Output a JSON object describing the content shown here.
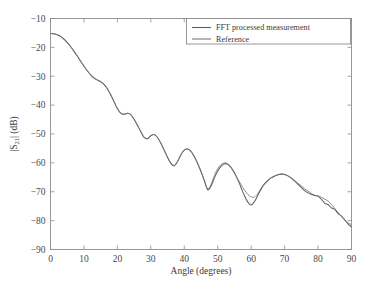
{
  "figure": {
    "background_color": "#ffffff",
    "frame_color": "#8d8d8d",
    "text_color": "#3a3a3a"
  },
  "axes": {
    "x_title": "Angle (degrees)",
    "y_title_main": "|S",
    "y_title_sub": "21",
    "y_title_tail": "| (dB)",
    "x_ticks": [
      "0",
      "10",
      "20",
      "30",
      "40",
      "50",
      "60",
      "70",
      "80",
      "90"
    ],
    "y_ticks": [
      "−10",
      "−20",
      "−30",
      "−40",
      "−50",
      "−60",
      "−70",
      "−80",
      "−90"
    ]
  },
  "legend": {
    "position": "top-right",
    "items": [
      {
        "label": "FFT processed measurement",
        "color": "#5e5e5e"
      },
      {
        "label": "Reference",
        "color": "#7a7a7a"
      }
    ]
  },
  "chart_data": {
    "type": "line",
    "title": "",
    "xlabel": "Angle (degrees)",
    "ylabel": "|S21| (dB)",
    "xlim": [
      0,
      90
    ],
    "ylim": [
      -90,
      -10
    ],
    "xticks": [
      0,
      10,
      20,
      30,
      40,
      50,
      60,
      70,
      80,
      90
    ],
    "yticks": [
      -90,
      -80,
      -70,
      -60,
      -50,
      -40,
      -30,
      -20,
      -10
    ],
    "grid": false,
    "legend_position": "upper right",
    "x": [
      0,
      1,
      2,
      3,
      4,
      5,
      6,
      7,
      8,
      9,
      10,
      11,
      12,
      13,
      14,
      15,
      16,
      17,
      18,
      19,
      20,
      21,
      22,
      23,
      24,
      25,
      26,
      27,
      28,
      29,
      30,
      31,
      32,
      33,
      34,
      35,
      36,
      37,
      38,
      39,
      40,
      41,
      42,
      43,
      44,
      45,
      46,
      47,
      48,
      49,
      50,
      51,
      52,
      53,
      54,
      55,
      56,
      57,
      58,
      59,
      60,
      61,
      62,
      63,
      64,
      65,
      66,
      67,
      68,
      69,
      70,
      71,
      72,
      73,
      74,
      75,
      76,
      77,
      78,
      79,
      80,
      81,
      82,
      83,
      84,
      85,
      86,
      87,
      88,
      89,
      90
    ],
    "series": [
      {
        "name": "FFT processed measurement",
        "color": "#5e5e5e",
        "values": [
          -15.2,
          -15.3,
          -15.6,
          -16.2,
          -17.1,
          -18.3,
          -19.7,
          -21.3,
          -23.0,
          -24.8,
          -26.5,
          -28.1,
          -29.5,
          -30.6,
          -31.3,
          -31.9,
          -32.8,
          -34.3,
          -36.4,
          -38.8,
          -41.2,
          -42.8,
          -43.2,
          -42.8,
          -43.3,
          -44.9,
          -47.0,
          -49.2,
          -51.2,
          -51.6,
          -50.6,
          -50.2,
          -51.2,
          -53.2,
          -55.6,
          -58.1,
          -60.2,
          -61.0,
          -59.5,
          -57.2,
          -55.6,
          -55.2,
          -56.0,
          -57.8,
          -60.2,
          -63.0,
          -66.2,
          -69.3,
          -68.0,
          -65.2,
          -62.8,
          -61.2,
          -60.3,
          -60.5,
          -61.6,
          -63.4,
          -65.8,
          -68.6,
          -71.4,
          -73.6,
          -74.6,
          -73.4,
          -71.2,
          -69.0,
          -67.3,
          -66.1,
          -65.2,
          -64.6,
          -64.1,
          -63.9,
          -64.0,
          -64.5,
          -65.3,
          -66.3,
          -67.4,
          -68.5,
          -69.6,
          -70.4,
          -70.9,
          -71.3,
          -71.6,
          -72.6,
          -74.0,
          -74.4,
          -75.6,
          -76.1,
          -77.6,
          -78.4,
          -79.8,
          -81.2,
          -82.2
        ]
      },
      {
        "name": "Reference",
        "color": "#7a7a7a",
        "values": [
          -15.2,
          -15.3,
          -15.6,
          -16.2,
          -17.1,
          -18.3,
          -19.7,
          -21.3,
          -23.0,
          -24.8,
          -26.5,
          -28.1,
          -29.5,
          -30.6,
          -31.3,
          -31.9,
          -32.8,
          -34.3,
          -36.4,
          -38.8,
          -41.2,
          -42.8,
          -43.2,
          -42.8,
          -43.3,
          -44.9,
          -47.0,
          -49.2,
          -51.2,
          -51.6,
          -50.6,
          -50.2,
          -51.2,
          -53.2,
          -55.6,
          -58.1,
          -60.2,
          -61.0,
          -59.5,
          -57.2,
          -55.6,
          -55.2,
          -56.0,
          -57.8,
          -60.2,
          -63.0,
          -66.0,
          -69.0,
          -67.4,
          -64.4,
          -62.0,
          -60.6,
          -60.0,
          -60.4,
          -61.7,
          -63.6,
          -65.6,
          -67.6,
          -69.4,
          -70.9,
          -71.8,
          -71.8,
          -70.6,
          -68.8,
          -67.2,
          -66.0,
          -65.1,
          -64.5,
          -64.1,
          -63.9,
          -64.0,
          -64.5,
          -65.2,
          -66.1,
          -67.1,
          -68.0,
          -69.0,
          -69.8,
          -70.6,
          -71.2,
          -71.4,
          -71.9,
          -72.6,
          -73.2,
          -74.4,
          -75.8,
          -77.2,
          -78.6,
          -79.8,
          -80.8,
          -81.4
        ]
      }
    ],
    "annotations": [
      "Two curves overlap closely from 0° to ~55°",
      "Largest divergence near the 60° null (−74.6 dB vs −71.8 dB)",
      "Fine ripple mismatch in the 78°–90° tail"
    ]
  }
}
